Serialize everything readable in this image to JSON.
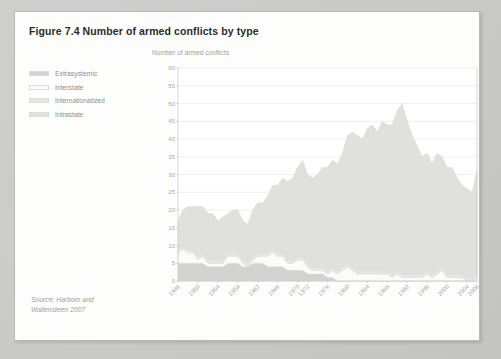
{
  "figure": {
    "title": "Figure 7.4 Number of armed conflicts by type",
    "source_line1": "Source: Harbom and",
    "source_line2": "Wallensteen 2007"
  },
  "legend": {
    "position": "left",
    "items": [
      {
        "label": "Extrasystemic",
        "color": "#d2d2d0"
      },
      {
        "label": "Interstate",
        "color": "#fbfbfa"
      },
      {
        "label": "Internationalized",
        "color": "#e6e6e4"
      },
      {
        "label": "Intrastate",
        "color": "#e0e0de"
      }
    ]
  },
  "colors": {
    "page_background": "#c9c9c7",
    "card_background": "#fdfdfc",
    "grid": "#e9e9e7",
    "axis": "#cdcdcb",
    "title_text": "#2b2b2b",
    "muted_text": "#a2a2a0"
  },
  "chart_data": {
    "type": "area",
    "stacked": true,
    "title": "Number of armed conflicts by type",
    "subtitle": "",
    "xlabel": "",
    "ylabel": "Number of armed conflicts",
    "ylim": [
      0,
      60
    ],
    "ytick_step": 5,
    "yticks": [
      0,
      5,
      10,
      15,
      20,
      25,
      30,
      35,
      40,
      45,
      50,
      55,
      60
    ],
    "grid": true,
    "xlim": [
      1946,
      2006
    ],
    "xtick_labels": [
      "1946",
      "1950",
      "1954",
      "1958",
      "1962",
      "1966",
      "1970",
      "1972",
      "1976",
      "1980",
      "1984",
      "1988",
      "1992",
      "1996",
      "2000",
      "2004",
      "2006"
    ],
    "xtick_values": [
      1946,
      1950,
      1954,
      1958,
      1962,
      1966,
      1970,
      1972,
      1976,
      1980,
      1984,
      1988,
      1992,
      1996,
      2000,
      2004,
      2006
    ],
    "xtick_rotation": -45,
    "x": [
      1946,
      1947,
      1948,
      1949,
      1950,
      1951,
      1952,
      1953,
      1954,
      1955,
      1956,
      1957,
      1958,
      1959,
      1960,
      1961,
      1962,
      1963,
      1964,
      1965,
      1966,
      1967,
      1968,
      1969,
      1970,
      1971,
      1972,
      1973,
      1974,
      1975,
      1976,
      1977,
      1978,
      1979,
      1980,
      1981,
      1982,
      1983,
      1984,
      1985,
      1986,
      1987,
      1988,
      1989,
      1990,
      1991,
      1992,
      1993,
      1994,
      1995,
      1996,
      1997,
      1998,
      1999,
      2000,
      2001,
      2002,
      2003,
      2004,
      2005,
      2006
    ],
    "series": [
      {
        "name": "Extrasystemic",
        "color": "#d2d2d0",
        "values": [
          5,
          5,
          5,
          5,
          5,
          5,
          4,
          4,
          4,
          4,
          5,
          5,
          5,
          4,
          4,
          5,
          5,
          5,
          4,
          4,
          4,
          4,
          3,
          3,
          3,
          3,
          2,
          2,
          2,
          2,
          1,
          1,
          0,
          0,
          0,
          0,
          0,
          0,
          0,
          0,
          0,
          0,
          0,
          0,
          0,
          0,
          0,
          0,
          0,
          0,
          0,
          0,
          0,
          0,
          0,
          0,
          0,
          0,
          0,
          0,
          0
        ]
      },
      {
        "name": "Interstate",
        "color": "#fbfbfa",
        "values": [
          3,
          4,
          3,
          3,
          1,
          2,
          1,
          1,
          1,
          1,
          2,
          2,
          2,
          1,
          0,
          1,
          2,
          2,
          3,
          4,
          3,
          3,
          2,
          2,
          3,
          3,
          2,
          1,
          1,
          1,
          1,
          2,
          2,
          3,
          4,
          3,
          2,
          2,
          2,
          2,
          2,
          2,
          2,
          1,
          2,
          1,
          1,
          1,
          1,
          1,
          2,
          1,
          2,
          3,
          1,
          1,
          1,
          1,
          0,
          0,
          1
        ]
      },
      {
        "name": "Internationalized",
        "color": "#e6e6e4",
        "values": [
          1,
          1,
          1,
          1,
          1,
          1,
          1,
          1,
          1,
          1,
          1,
          1,
          1,
          1,
          1,
          1,
          1,
          1,
          1,
          1,
          1,
          1,
          1,
          1,
          1,
          1,
          1,
          1,
          1,
          1,
          1,
          1,
          1,
          1,
          1,
          1,
          1,
          1,
          1,
          1,
          1,
          1,
          1,
          1,
          1,
          1,
          1,
          1,
          1,
          1,
          1,
          1,
          1,
          1,
          1,
          1,
          1,
          1,
          1,
          1,
          1
        ]
      },
      {
        "name": "Intrastate",
        "color": "#e0e0de",
        "values": [
          8,
          10,
          12,
          12,
          14,
          13,
          13,
          13,
          11,
          12,
          11,
          12,
          12,
          11,
          11,
          13,
          14,
          14,
          16,
          18,
          19,
          21,
          22,
          23,
          25,
          27,
          25,
          25,
          26,
          28,
          29,
          30,
          30,
          32,
          36,
          38,
          38,
          37,
          40,
          41,
          39,
          42,
          41,
          42,
          45,
          48,
          43,
          39,
          36,
          33,
          33,
          31,
          33,
          31,
          30,
          30,
          27,
          25,
          25,
          24,
          29
        ]
      }
    ],
    "totals": [
      17,
      20,
      21,
      21,
      21,
      21,
      19,
      19,
      17,
      18,
      19,
      20,
      20,
      17,
      16,
      20,
      22,
      22,
      24,
      27,
      27,
      29,
      28,
      29,
      32,
      34,
      30,
      29,
      30,
      32,
      32,
      34,
      33,
      36,
      41,
      42,
      41,
      40,
      43,
      44,
      42,
      45,
      44,
      44,
      48,
      51,
      45,
      41,
      38,
      35,
      36,
      33,
      36,
      35,
      32,
      32,
      29,
      27,
      26,
      25,
      31
    ],
    "peak": {
      "year": 1991,
      "value": 51
    },
    "end_value": {
      "year": 2006,
      "value": 31
    }
  }
}
